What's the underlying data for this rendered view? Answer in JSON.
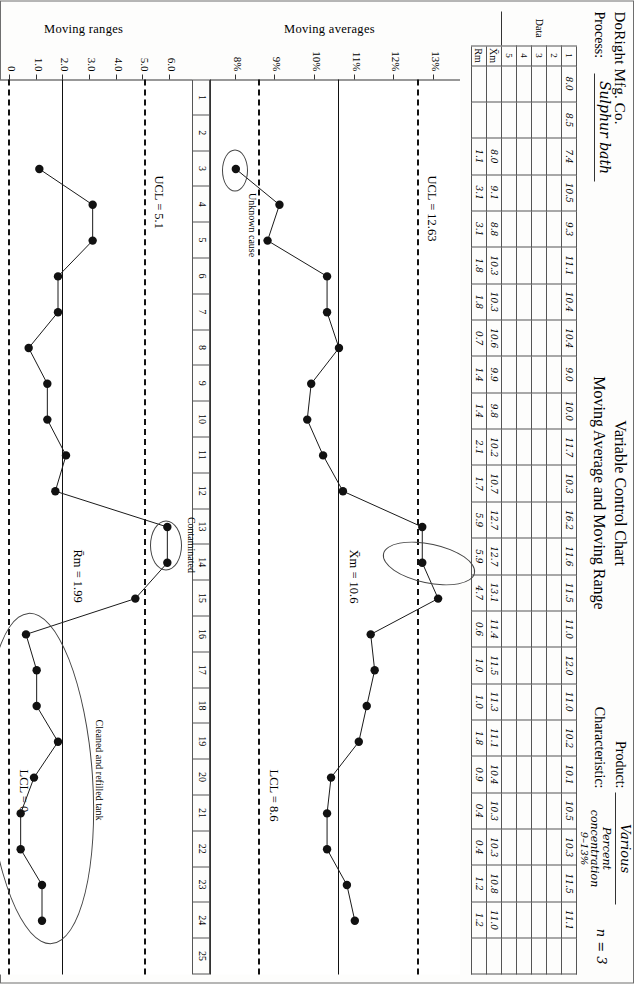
{
  "header": {
    "company": "DoRight Mfg. Co.",
    "process_label": "Process:",
    "process_value": "Sulphur bath",
    "title_line1": "Variable Control Chart",
    "title_line2": "Moving Average and Moving Range",
    "product_label": "Product:",
    "product_value": "Various",
    "characteristic_label": "Characteristic:",
    "characteristic_value": "Percent concentration",
    "characteristic_sub": "9–13%",
    "n_value": "n = 3"
  },
  "table": {
    "data_group_label": "Data",
    "row_labels": [
      "1",
      "2",
      "3",
      "4",
      "5"
    ],
    "xbar_label": "X̄m",
    "rm_label": "Rm",
    "columns": 25,
    "row1": [
      "8.0",
      "8.5",
      "7.4",
      "10.5",
      "9.3",
      "11.1",
      "10.4",
      "10.4",
      "9.0",
      "10.0",
      "11.7",
      "10.3",
      "16.2",
      "11.6",
      "11.5",
      "11.0",
      "12.0",
      "11.0",
      "10.2",
      "10.1",
      "10.5",
      "10.3",
      "11.5",
      "11.1",
      ""
    ],
    "row2": [
      "",
      "",
      "",
      "",
      "",
      "",
      "",
      "",
      "",
      "",
      "",
      "",
      "",
      "",
      "",
      "",
      "",
      "",
      "",
      "",
      "",
      "",
      "",
      "",
      ""
    ],
    "row3": [
      "",
      "",
      "",
      "",
      "",
      "",
      "",
      "",
      "",
      "",
      "",
      "",
      "",
      "",
      "",
      "",
      "",
      "",
      "",
      "",
      "",
      "",
      "",
      "",
      ""
    ],
    "row4": [
      "",
      "",
      "",
      "",
      "",
      "",
      "",
      "",
      "",
      "",
      "",
      "",
      "",
      "",
      "",
      "",
      "",
      "",
      "",
      "",
      "",
      "",
      "",
      "",
      ""
    ],
    "row5": [
      "",
      "",
      "",
      "",
      "",
      "",
      "",
      "",
      "",
      "",
      "",
      "",
      "",
      "",
      "",
      "",
      "",
      "",
      "",
      "",
      "",
      "",
      "",
      "",
      ""
    ],
    "xbar": [
      "",
      "",
      "8.0",
      "9.1",
      "8.8",
      "10.3",
      "10.3",
      "10.6",
      "9.9",
      "9.8",
      "10.2",
      "10.7",
      "12.7",
      "12.7",
      "13.1",
      "11.4",
      "11.5",
      "11.3",
      "11.1",
      "10.4",
      "10.3",
      "10.3",
      "10.8",
      "11.0",
      ""
    ],
    "rm": [
      "",
      "",
      "1.1",
      "3.1",
      "3.1",
      "1.8",
      "1.8",
      "0.7",
      "1.4",
      "1.4",
      "2.1",
      "1.7",
      "5.9",
      "5.9",
      "4.7",
      "0.6",
      "1.0",
      "1.0",
      "1.8",
      "0.9",
      "0.4",
      "0.4",
      "1.2",
      "1.2",
      ""
    ]
  },
  "chart_data": [
    {
      "type": "line",
      "name": "moving-averages",
      "ylabel": "Moving averages",
      "xlabel": "",
      "x": [
        3,
        4,
        5,
        6,
        7,
        8,
        9,
        10,
        11,
        12,
        13,
        14,
        15,
        16,
        17,
        18,
        19,
        20,
        21,
        22,
        23,
        24
      ],
      "values": [
        8.0,
        9.1,
        8.8,
        10.3,
        10.3,
        10.6,
        9.9,
        9.8,
        10.2,
        10.7,
        12.7,
        12.7,
        13.1,
        11.4,
        11.5,
        11.3,
        11.1,
        10.4,
        10.3,
        10.3,
        10.8,
        11.0
      ],
      "yticks": [
        "13%",
        "12%",
        "11%",
        "10%",
        "9%",
        "8%"
      ],
      "ytickvals": [
        13,
        12,
        11,
        10,
        9,
        8
      ],
      "ylim": [
        7.5,
        13.5
      ],
      "xlim": [
        1,
        25
      ],
      "ucl": 12.63,
      "ucl_label": "UCL = 12.63",
      "center": 10.6,
      "center_label": "X̄m = 10.6",
      "lcl": 8.6,
      "lcl_label": "LCL = 8.6",
      "annotations": [
        {
          "text": "Unknown cause",
          "points": [
            3
          ]
        },
        {
          "text": "",
          "points": [
            13,
            14,
            15
          ]
        }
      ]
    },
    {
      "type": "line",
      "name": "moving-ranges",
      "ylabel": "Moving ranges",
      "xlabel": "",
      "x": [
        3,
        4,
        5,
        6,
        7,
        8,
        9,
        10,
        11,
        12,
        13,
        14,
        15,
        16,
        17,
        18,
        19,
        20,
        21,
        22,
        23,
        24
      ],
      "values": [
        1.1,
        3.1,
        3.1,
        1.8,
        1.8,
        0.7,
        1.4,
        1.4,
        2.1,
        1.7,
        5.9,
        5.9,
        4.7,
        0.6,
        1.0,
        1.0,
        1.8,
        0.9,
        0.4,
        0.4,
        1.2,
        1.2
      ],
      "yticks": [
        "6.0",
        "5.0",
        "4.0",
        "3.0",
        "2.0",
        "1.0",
        "0"
      ],
      "ytickvals": [
        6,
        5,
        4,
        3,
        2,
        1,
        0
      ],
      "ylim": [
        -0.75,
        6.6
      ],
      "xlim": [
        1,
        25
      ],
      "ucl": 5.1,
      "ucl_label": "UCL = 5.1",
      "center": 1.99,
      "center_label": "R̄m = 1.99",
      "lcl": 0,
      "lcl_label": "LCL = 0",
      "annotations": [
        {
          "text": "Contaminated",
          "points": [
            13,
            14
          ]
        },
        {
          "text": "Cleaned and refilled tank",
          "points": [
            16,
            17,
            18,
            19,
            20,
            21,
            22,
            23,
            24
          ]
        }
      ]
    }
  ],
  "xaxis": {
    "ticks": [
      "1",
      "2",
      "3",
      "4",
      "5",
      "6",
      "7",
      "8",
      "9",
      "10",
      "11",
      "12",
      "13",
      "14",
      "15",
      "16",
      "17",
      "18",
      "19",
      "20",
      "21",
      "22",
      "23",
      "24",
      "25"
    ]
  }
}
